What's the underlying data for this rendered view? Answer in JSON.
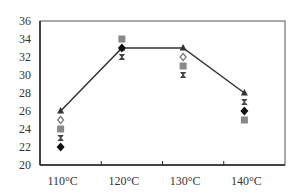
{
  "chart_data": {
    "type": "line",
    "title": "",
    "xlabel": "",
    "ylabel": "",
    "categories": [
      "110°C",
      "120°C",
      "130°C",
      "140°C"
    ],
    "ylim": [
      20,
      36
    ],
    "yticks": [
      20,
      22,
      24,
      26,
      28,
      30,
      32,
      34,
      36
    ],
    "grid": false,
    "legend": null,
    "series": [
      {
        "name": "line (triangle)",
        "marker": "triangle",
        "style": "line",
        "color": "#333333",
        "values": [
          26,
          33,
          33,
          28
        ]
      },
      {
        "name": "square",
        "marker": "square",
        "style": "scatter",
        "color": "#888888",
        "values": [
          24,
          34,
          31,
          25
        ]
      },
      {
        "name": "x-mark",
        "marker": "x",
        "style": "scatter",
        "color": "#444444",
        "values": [
          23,
          32,
          30,
          27
        ]
      },
      {
        "name": "diamond",
        "marker": "diamond",
        "style": "scatter",
        "color": "#111111",
        "values": [
          22,
          33,
          null,
          26
        ]
      },
      {
        "name": "open diamond",
        "marker": "open-diamond",
        "style": "scatter",
        "color": "#777777",
        "values": [
          25,
          null,
          32,
          null
        ]
      }
    ]
  }
}
